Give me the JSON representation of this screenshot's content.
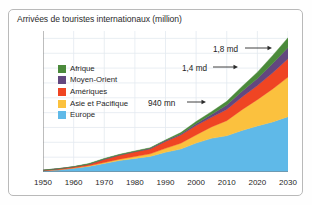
{
  "figure": {
    "title": "Arrivées de touristes internationaux (million)"
  },
  "sections": {
    "actual": "Chiffres réels",
    "projection": "Projections"
  },
  "legend": {
    "items": [
      {
        "label": "Afrique",
        "color": "#4b8a3b"
      },
      {
        "label": "Moyen-Orient",
        "color": "#63477f"
      },
      {
        "label": "Amériques",
        "color": "#ef4523"
      },
      {
        "label": "Asie et Pacifique",
        "color": "#fbc13e"
      },
      {
        "label": "Europe",
        "color": "#5fb9e8"
      }
    ]
  },
  "annotations": [
    {
      "text": "940 mn",
      "label_x": 148,
      "label_y": 99,
      "arrow_from_x": 187,
      "arrow_from_y": 102,
      "arrow_to_x": 206,
      "arrow_to_y": 102
    },
    {
      "text": "1,4 md",
      "label_x": 182,
      "label_y": 64,
      "arrow_from_x": 213,
      "arrow_from_y": 67,
      "arrow_to_x": 238,
      "arrow_to_y": 67
    },
    {
      "text": "1,8 md",
      "label_x": 213,
      "label_y": 45,
      "arrow_from_x": 245,
      "arrow_from_y": 48,
      "arrow_to_x": 272,
      "arrow_to_y": 48
    }
  ],
  "chart_data": {
    "type": "area",
    "title": "Arrivées de touristes internationaux (million)",
    "subtitle": "",
    "xlabel": "",
    "ylabel": "million",
    "stacked": true,
    "grid": true,
    "legend_position": "inside-left",
    "xlim": [
      1950,
      2030
    ],
    "ylim": [
      0,
      1900
    ],
    "yticks": [
      0,
      200,
      400,
      600,
      800,
      1000,
      1200,
      1400,
      1600,
      1800
    ],
    "ytick_labels": [
      "0",
      "200",
      "400",
      "600",
      "800",
      "1 000",
      "1 200",
      "1 400",
      "1 600",
      "1 800"
    ],
    "xticks": [
      1950,
      1960,
      1970,
      1980,
      1990,
      2000,
      2010,
      2020,
      2030
    ],
    "xtick_labels": [
      "1950",
      "1960",
      "1970",
      "1980",
      "1990",
      "2000",
      "2010",
      "2020",
      "2030"
    ],
    "x": [
      1950,
      1955,
      1960,
      1965,
      1970,
      1975,
      1980,
      1985,
      1990,
      1995,
      2000,
      2005,
      2010,
      2015,
      2020,
      2025,
      2030
    ],
    "series": [
      {
        "name": "Europe",
        "color": "#5fb9e8",
        "values": [
          17,
          29,
          50,
          75,
          113,
          154,
          186,
          212,
          265,
          310,
          390,
          450,
          488,
          560,
          620,
          675,
          744
        ]
      },
      {
        "name": "Asie et Pacifique",
        "color": "#fbc13e",
        "values": [
          0.2,
          1,
          3,
          6,
          11,
          19,
          23,
          33,
          56,
          82,
          110,
          154,
          204,
          280,
          355,
          445,
          535
        ]
      },
      {
        "name": "Amériques",
        "color": "#ef4523",
        "values": [
          7,
          13,
          17,
          23,
          43,
          50,
          62,
          65,
          92,
          109,
          128,
          133,
          150,
          172,
          190,
          218,
          248
        ]
      },
      {
        "name": "Moyen-Orient",
        "color": "#63477f",
        "values": [
          0.2,
          0.6,
          1,
          2,
          6,
          8,
          7,
          9,
          9,
          13,
          24,
          36,
          60,
          76,
          95,
          123,
          149
        ]
      },
      {
        "name": "Afrique",
        "color": "#4b8a3b",
        "values": [
          0.5,
          1,
          1,
          3,
          6,
          9,
          7,
          9,
          15,
          20,
          26,
          35,
          50,
          65,
          85,
          110,
          134
        ]
      }
    ],
    "totals": [
      25,
      45,
      72,
      109,
      179,
      240,
      285,
      328,
      437,
      534,
      678,
      808,
      952,
      1153,
      1345,
      1571,
      1810
    ],
    "callouts": [
      {
        "text": "940 mn",
        "year": 2010,
        "value": 940
      },
      {
        "text": "1,4 md",
        "year": 2020,
        "value": 1400
      },
      {
        "text": "1,8 md",
        "year": 2030,
        "value": 1800
      }
    ]
  }
}
